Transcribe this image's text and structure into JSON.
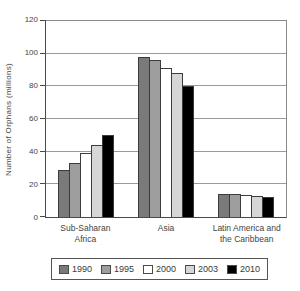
{
  "chart_data": {
    "type": "bar",
    "title": "",
    "ylabel": "Number of Orphans (millions)",
    "ylim": [
      0,
      120
    ],
    "yticks": [
      0,
      20,
      40,
      60,
      80,
      100,
      120
    ],
    "grid": true,
    "legend_position": "bottom",
    "categories": [
      [
        "Sub-Saharan",
        "Africa"
      ],
      [
        "Asia"
      ],
      [
        "Latin America and",
        "the Caribbean"
      ]
    ],
    "series": [
      {
        "name": "1990",
        "color": "#7a7a7a",
        "values": [
          29,
          98,
          14
        ]
      },
      {
        "name": "1995",
        "color": "#9e9e9e",
        "values": [
          33,
          96,
          14
        ]
      },
      {
        "name": "2000",
        "color": "#ffffff",
        "values": [
          39,
          91,
          13.5
        ]
      },
      {
        "name": "2003",
        "color": "#d6d6d6",
        "values": [
          44,
          88,
          13
        ]
      },
      {
        "name": "2010",
        "color": "#000000",
        "values": [
          50,
          80,
          12.5
        ]
      }
    ]
  }
}
